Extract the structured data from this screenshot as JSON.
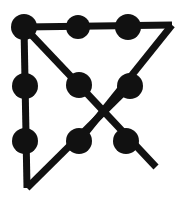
{
  "figure": {
    "type": "graph-diagram",
    "background_color": "#ffffff",
    "stroke_color": "#111111",
    "node_fill_color": "#111111",
    "canvas": {
      "width": 186,
      "height": 203
    },
    "stroke_width": 7,
    "node_radius": 12.5,
    "nodes": [
      {
        "id": "n1",
        "label": "top-left",
        "x": 24,
        "y": 27,
        "r": 13
      },
      {
        "id": "n2",
        "label": "top-center",
        "x": 78,
        "y": 27,
        "r": 12
      },
      {
        "id": "n3",
        "label": "top-right",
        "x": 128,
        "y": 27,
        "r": 13
      },
      {
        "id": "n4",
        "label": "middle-left",
        "x": 25,
        "y": 86,
        "r": 13
      },
      {
        "id": "n5",
        "label": "middle-center",
        "x": 79,
        "y": 85,
        "r": 13
      },
      {
        "id": "n6",
        "label": "middle-right",
        "x": 130,
        "y": 86,
        "r": 13
      },
      {
        "id": "n7",
        "label": "bottom-left",
        "x": 25,
        "y": 141,
        "r": 13
      },
      {
        "id": "n8",
        "label": "bottom-center",
        "x": 79,
        "y": 141,
        "r": 13
      },
      {
        "id": "n9",
        "label": "bottom-right",
        "x": 126,
        "y": 141,
        "r": 13
      }
    ],
    "vertices": [
      {
        "id": "v-right",
        "label": "right-corner",
        "x": 172,
        "y": 25
      },
      {
        "id": "v-bottom",
        "label": "bottom-corner",
        "x": 27,
        "y": 188
      },
      {
        "id": "v-tail",
        "label": "tail-end",
        "x": 156,
        "y": 167
      }
    ],
    "edges": [
      {
        "id": "e1",
        "label": "top-horizontal",
        "from": "n1",
        "to": "v-right"
      },
      {
        "id": "e2",
        "label": "left-vertical",
        "from": "n1",
        "to": "v-bottom"
      },
      {
        "id": "e3",
        "label": "upper-diagonal",
        "from": "n1",
        "to": "n5"
      },
      {
        "id": "e4",
        "label": "right-down-diagonal",
        "from": "v-right",
        "to": "n8"
      },
      {
        "id": "e5",
        "label": "cross-diagonal-tail",
        "from": "n5",
        "to": "v-tail"
      },
      {
        "id": "e6",
        "label": "bottom-up-diagonal",
        "from": "v-bottom",
        "to": "n6"
      }
    ]
  }
}
